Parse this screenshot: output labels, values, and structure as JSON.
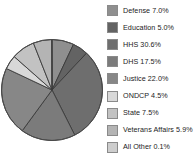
{
  "chart_data": {
    "type": "pie",
    "title": "",
    "subtitle": "",
    "xlabel": "",
    "ylabel": "",
    "legend_position": "right",
    "grid": false,
    "start_angle_deg": 0,
    "direction": "clockwise",
    "total_percent": 100.1,
    "categories": [
      "Defense",
      "Education",
      "HHS",
      "DHS",
      "Justice",
      "ONDCP",
      "State",
      "Veterans Affairs",
      "All Other"
    ],
    "values": [
      7.0,
      5.0,
      30.6,
      17.5,
      22.0,
      4.5,
      7.5,
      5.9,
      0.1
    ],
    "value_unit": "%",
    "colors": [
      "#8f8f8f",
      "#636363",
      "#6e6e6e",
      "#7b7b7b",
      "#878787",
      "#d8d8d8",
      "#c2c2c2",
      "#b4b4b4",
      "#cdcdcd"
    ],
    "slice_border_color": "#3a3a3a",
    "outline_color": "#4a4a4a",
    "legend_entries": [
      {
        "label": "Defense 7.0%",
        "color": "#8f8f8f"
      },
      {
        "label": "Education 5.0%",
        "color": "#636363"
      },
      {
        "label": "HHS 30.6%",
        "color": "#6e6e6e"
      },
      {
        "label": "DHS 17.5%",
        "color": "#7b7b7b"
      },
      {
        "label": "Justice 22.0%",
        "color": "#878787"
      },
      {
        "label": "ONDCP 4.5%",
        "color": "#d8d8d8"
      },
      {
        "label": "State 7.5%",
        "color": "#c2c2c2"
      },
      {
        "label": "Veterans Affairs 5.9%",
        "color": "#b4b4b4"
      },
      {
        "label": "All Other 0.1%",
        "color": "#cdcdcd"
      }
    ]
  },
  "legend": {
    "items": [
      {
        "label": "Defense 7.0%"
      },
      {
        "label": "Education 5.0%"
      },
      {
        "label": "HHS 30.6%"
      },
      {
        "label": "DHS 17.5%"
      },
      {
        "label": "Justice 22.0%"
      },
      {
        "label": "ONDCP 4.5%"
      },
      {
        "label": "State 7.5%"
      },
      {
        "label": "Veterans Affairs 5.9%"
      },
      {
        "label": "All Other 0.1%"
      }
    ]
  }
}
